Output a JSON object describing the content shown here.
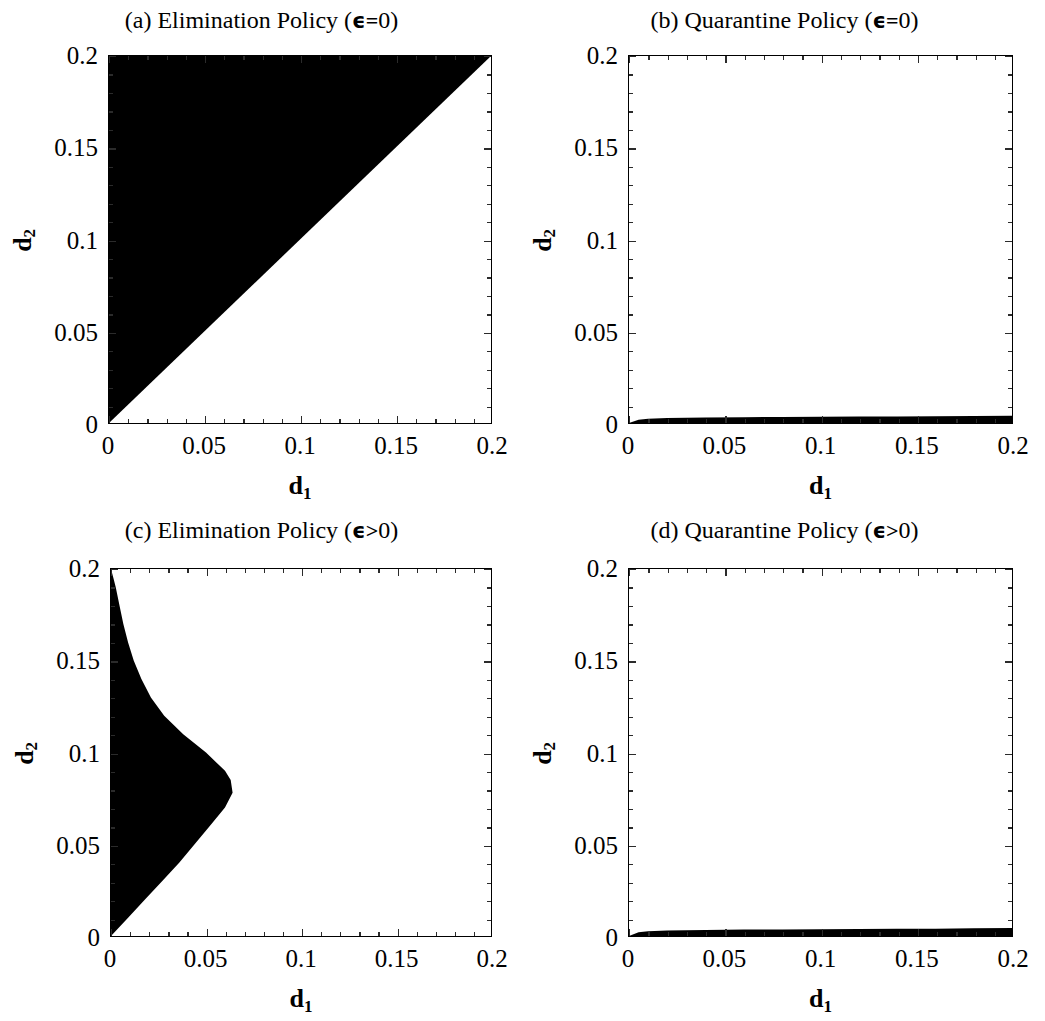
{
  "figure": {
    "background_color": "#ffffff",
    "region_fill_color": "#000000",
    "frame_color": "#000000",
    "panel_count": 4,
    "layout": "2x2"
  },
  "axes": {
    "x_title_base": "d",
    "x_title_sub": "1",
    "y_title_base": "d",
    "y_title_sub": "2",
    "x_tick_labels": [
      "0",
      "0.05",
      "0.1",
      "0.15",
      "0.2"
    ],
    "y_tick_labels": [
      "0",
      "0.05",
      "0.1",
      "0.15",
      "0.2"
    ],
    "x_tick_values": [
      0,
      0.05,
      0.1,
      0.15,
      0.2
    ],
    "y_tick_values": [
      0,
      0.05,
      0.1,
      0.15,
      0.2
    ],
    "minor_ticks_between_majors": 4,
    "xlim": [
      0,
      0.2
    ],
    "ylim": [
      0,
      0.2
    ]
  },
  "panels": [
    {
      "id": "a",
      "label": "(a)",
      "policy": "Elimination Policy",
      "condition_symbol": "ϵ",
      "condition_relation": "=",
      "condition_value": "0",
      "title_prefix": "(a) Elimination Policy (",
      "title_suffix": ")"
    },
    {
      "id": "b",
      "label": "(b)",
      "policy": "Quarantine Policy",
      "condition_symbol": "ϵ",
      "condition_relation": "=",
      "condition_value": "0",
      "title_prefix": "(b) Quarantine Policy (",
      "title_suffix": ")"
    },
    {
      "id": "c",
      "label": "(c)",
      "policy": "Elimination Policy",
      "condition_symbol": "ϵ",
      "condition_relation": ">",
      "condition_value": "0",
      "title_prefix": "(c) Elimination Policy (",
      "title_suffix": ")"
    },
    {
      "id": "d",
      "label": "(d)",
      "policy": "Quarantine Policy",
      "condition_symbol": "ϵ",
      "condition_relation": ">",
      "condition_value": "0",
      "title_prefix": "(d) Quarantine Policy (",
      "title_suffix": ")"
    }
  ],
  "chart_data": [
    {
      "type": "area",
      "panel": "a",
      "title": "(a) Elimination Policy (ϵ=0)",
      "xlabel": "d1",
      "ylabel": "d2",
      "xlim": [
        0,
        0.2
      ],
      "ylim": [
        0,
        0.2
      ],
      "grid": false,
      "legend": null,
      "region_description": "Upper-left triangle: shaded where d2 > d1",
      "boundary_x": [
        0,
        0.2
      ],
      "boundary_y": [
        0,
        0.2
      ],
      "shaded_polygon_x": [
        0,
        0,
        0.2
      ],
      "shaded_polygon_y": [
        0,
        0.2,
        0.2
      ],
      "shaded_area_fraction": 0.5
    },
    {
      "type": "area",
      "panel": "b",
      "title": "(b) Quarantine Policy (ϵ=0)",
      "xlabel": "d1",
      "ylabel": "d2",
      "xlim": [
        0,
        0.2
      ],
      "ylim": [
        0,
        0.2
      ],
      "grid": false,
      "legend": null,
      "region_description": "Thin sliver along the bottom axis, shaded between d2=0 and an upper boundary rising steeply near d1=0 then nearly flat",
      "boundary_x": [
        0,
        0.005,
        0.01,
        0.02,
        0.04,
        0.06,
        0.08,
        0.1,
        0.12,
        0.14,
        0.16,
        0.18,
        0.2
      ],
      "boundary_y": [
        0,
        0.0018,
        0.0023,
        0.0027,
        0.003,
        0.0032,
        0.0033,
        0.0034,
        0.0035,
        0.0036,
        0.0037,
        0.0038,
        0.004
      ],
      "shaded_area_fraction": 0.017
    },
    {
      "type": "area",
      "panel": "c",
      "title": "(c) Elimination Policy (ϵ>0)",
      "xlabel": "d1",
      "ylabel": "d2",
      "xlim": [
        0,
        0.2
      ],
      "ylim": [
        0,
        0.2
      ],
      "grid": false,
      "legend": null,
      "region_description": "Leaf / teardrop shaped region anchored on the left axis from d2=0 to d2=0.2, widest near d2=0.078 where d1 reaches about 0.064, cusping to zero width at d2=0.2 and tapering to the origin at d2=0",
      "boundary_d2": [
        0,
        0.01,
        0.02,
        0.03,
        0.04,
        0.05,
        0.06,
        0.07,
        0.078,
        0.085,
        0.09,
        0.1,
        0.11,
        0.12,
        0.13,
        0.14,
        0.15,
        0.16,
        0.17,
        0.18,
        0.19,
        0.195,
        0.2
      ],
      "boundary_d1_max": [
        0,
        0.009,
        0.018,
        0.027,
        0.036,
        0.044,
        0.052,
        0.06,
        0.064,
        0.063,
        0.06,
        0.05,
        0.038,
        0.028,
        0.021,
        0.016,
        0.012,
        0.009,
        0.0065,
        0.0045,
        0.0025,
        0.0013,
        0
      ],
      "peak_d1": 0.064,
      "peak_d2": 0.078,
      "shaded_area_fraction": 0.18
    },
    {
      "type": "area",
      "panel": "d",
      "title": "(d) Quarantine Policy (ϵ>0)",
      "xlabel": "d1",
      "ylabel": "d2",
      "xlim": [
        0,
        0.2
      ],
      "ylim": [
        0,
        0.2
      ],
      "grid": false,
      "legend": null,
      "region_description": "Thin sliver along the bottom axis, slightly thicker than panel (b), rising steeply near d1=0 then nearly flat to the right edge",
      "boundary_x": [
        0,
        0.005,
        0.01,
        0.02,
        0.04,
        0.06,
        0.08,
        0.1,
        0.12,
        0.14,
        0.16,
        0.18,
        0.2
      ],
      "boundary_y": [
        0,
        0.002,
        0.0026,
        0.003,
        0.0033,
        0.0035,
        0.0036,
        0.0037,
        0.0038,
        0.0039,
        0.004,
        0.0042,
        0.0044
      ],
      "shaded_area_fraction": 0.019
    }
  ]
}
